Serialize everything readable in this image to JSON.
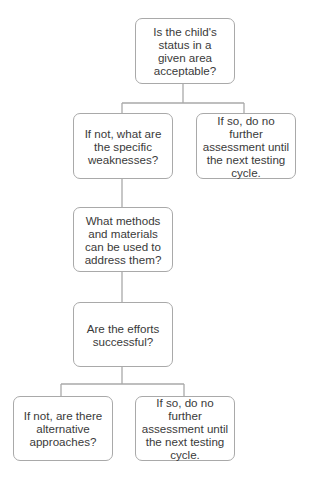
{
  "diagram": {
    "type": "flowchart",
    "colors": {
      "box_border": "#a9a9a9",
      "connector": "#a9a9a9",
      "text": "#3a3a3a",
      "background": "#ffffff"
    },
    "nodes": [
      {
        "id": "n1",
        "text": "Is the child's status in a given area acceptable?"
      },
      {
        "id": "n2",
        "text": "If not, what are the specific weaknesses?"
      },
      {
        "id": "n3",
        "text": "If so, do no further assessment until the next testing cycle."
      },
      {
        "id": "n4",
        "text": "What methods and materials can be used to address them?"
      },
      {
        "id": "n5",
        "text": "Are the efforts successful?"
      },
      {
        "id": "n6",
        "text": "If not, are there alternative approaches?"
      },
      {
        "id": "n7",
        "text": "If so, do no further assessment until the next testing cycle."
      }
    ],
    "edges": [
      {
        "from": "n1",
        "to": "n2"
      },
      {
        "from": "n1",
        "to": "n3"
      },
      {
        "from": "n2",
        "to": "n4"
      },
      {
        "from": "n4",
        "to": "n5"
      },
      {
        "from": "n5",
        "to": "n6"
      },
      {
        "from": "n5",
        "to": "n7"
      }
    ]
  }
}
